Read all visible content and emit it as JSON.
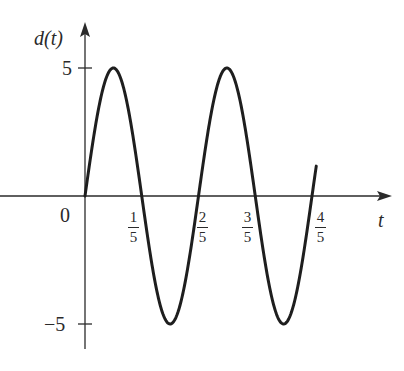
{
  "chart_data": {
    "type": "line",
    "title": "",
    "xlabel": "t",
    "ylabel": "d(t)",
    "function": "d(t) = 5 sin(5πt)",
    "x_ticks": [
      {
        "value": 0.2,
        "num": "1",
        "den": "5"
      },
      {
        "value": 0.4,
        "num": "2",
        "den": "5"
      },
      {
        "value": 0.6,
        "num": "3",
        "den": "5"
      },
      {
        "value": 0.8,
        "num": "4",
        "den": "5"
      }
    ],
    "origin_label": "0",
    "y_ticks": [
      {
        "value": 5,
        "label": "5"
      },
      {
        "value": -5,
        "label": "−5"
      }
    ],
    "xlim": [
      0,
      0.82
    ],
    "ylim": [
      -5,
      5
    ],
    "grid": false,
    "legend": null,
    "series": [
      {
        "name": "d(t)",
        "x": [
          0,
          0.1,
          0.2,
          0.3,
          0.4,
          0.5,
          0.6,
          0.7,
          0.8
        ],
        "values": [
          0,
          5,
          0,
          -5,
          0,
          5,
          0,
          -5,
          0
        ]
      }
    ],
    "key_points": {
      "peaks": [
        [
          0.1,
          5
        ],
        [
          0.5,
          5
        ]
      ],
      "troughs": [
        [
          0.3,
          -5
        ],
        [
          0.7,
          -5
        ]
      ],
      "zero_crossings": [
        0,
        0.2,
        0.4,
        0.6,
        0.8
      ]
    }
  },
  "colors": {
    "axis": "#2a2a2a",
    "curve": "#1e1e1e",
    "background": "#ffffff"
  },
  "labels": {
    "ylabel": "d(t)",
    "xlabel": "t",
    "origin": "0",
    "y_top": "5",
    "y_bottom": "−5",
    "x1_num": "1",
    "x1_den": "5",
    "x2_num": "2",
    "x2_den": "5",
    "x3_num": "3",
    "x3_den": "5",
    "x4_num": "4",
    "x4_den": "5"
  }
}
